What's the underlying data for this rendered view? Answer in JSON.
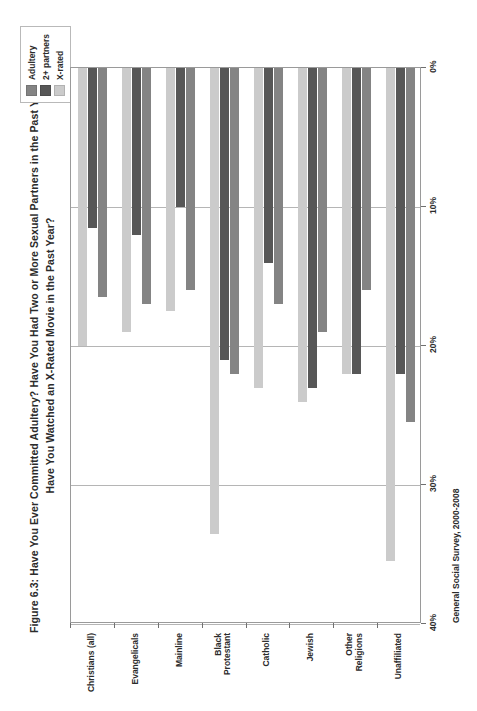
{
  "figure": {
    "title_lines": [
      "Figure 6.3: Have You Ever Committed Adultery?  Have You Had Two or More Sexual Partners in the Past Year?",
      "Have You Watched an X-Rated Movie in the Past Year?"
    ],
    "source_note": "General Social Survey, 2000-2008"
  },
  "legend": {
    "items": [
      {
        "label": "Adultery",
        "color": "#848484"
      },
      {
        "label": "2+ partners",
        "color": "#575757"
      },
      {
        "label": "X-rated",
        "color": "#cbcbcb"
      }
    ]
  },
  "axis": {
    "tick_labels": [
      "40%",
      "30%",
      "20%",
      "10%",
      "0%"
    ],
    "tick_values": [
      40,
      30,
      20,
      10,
      0
    ]
  },
  "chart_data": {
    "type": "bar",
    "orientation": "horizontal",
    "title": "Figure 6.3: Have You Ever Committed Adultery?  Have You Had Two or More Sexual Partners in the Past Year? Have You Watched an X-Rated Movie in the Past Year?",
    "xlabel": "",
    "ylabel": "",
    "xlim": [
      0,
      40
    ],
    "grid": true,
    "grid_axis": "x",
    "legend_position": "top-right",
    "source": "General Social Survey, 2000-2008",
    "categories": [
      "Christians (all)",
      "Evangelicals",
      "Mainline",
      "Black Protestant",
      "Catholic",
      "Jewish",
      "Other Religions",
      "Unaffiliated"
    ],
    "series": [
      {
        "name": "Adultery",
        "color": "#848484",
        "values": [
          16.5,
          17.0,
          16.0,
          22.0,
          17.0,
          19.0,
          16.0,
          25.5
        ]
      },
      {
        "name": "2+ partners",
        "color": "#575757",
        "values": [
          11.5,
          12.0,
          10.0,
          21.0,
          14.0,
          23.0,
          22.0,
          22.0
        ]
      },
      {
        "name": "X-rated",
        "color": "#cbcbcb",
        "values": [
          20.0,
          19.0,
          17.5,
          33.5,
          23.0,
          24.0,
          22.0,
          35.5
        ]
      }
    ]
  }
}
